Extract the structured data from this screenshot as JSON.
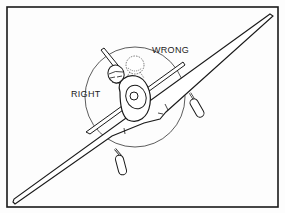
{
  "figure": {
    "labels": {
      "wrong": "WRONG",
      "right": "RIGHT"
    },
    "colors": {
      "line": "#1a1a1a",
      "background": "#ffffff",
      "dashed_head": "#555555"
    }
  }
}
